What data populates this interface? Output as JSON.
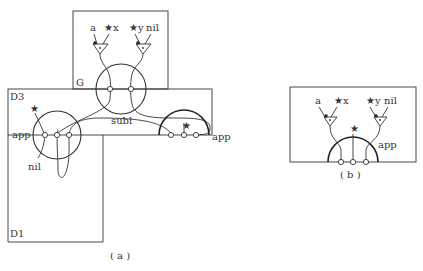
{
  "figure_a": {
    "caption": "( a )",
    "boxes": {
      "g": "G",
      "d3": "D3",
      "d1": "D1"
    },
    "labels": {
      "a": "a",
      "star_x": "★x",
      "star_y": "★y",
      "nil_top": "nil",
      "subl": "subl",
      "app_left": "app",
      "app_right": "app",
      "nil_bottom": "nil",
      "star_left": "★",
      "star_right": "★"
    }
  },
  "figure_b": {
    "caption": "( b )",
    "labels": {
      "a": "a",
      "star_x": "★x",
      "star_y": "★y",
      "nil": "nil",
      "app": "app",
      "star_mid": "★"
    }
  }
}
